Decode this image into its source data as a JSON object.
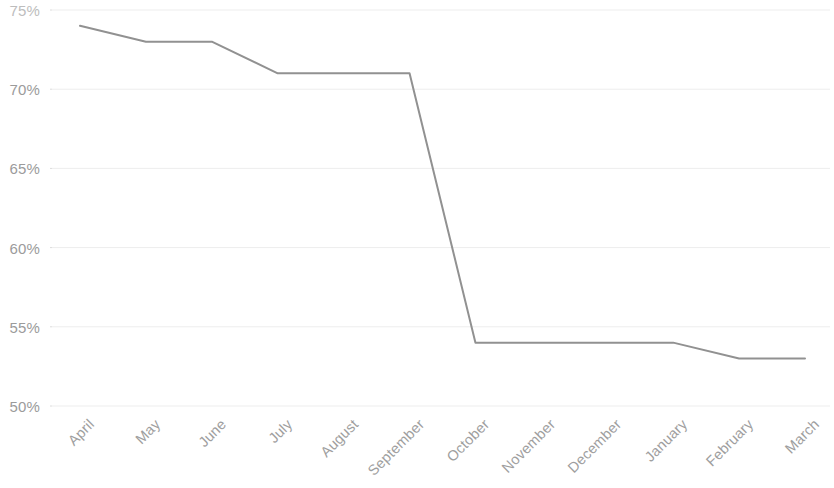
{
  "chart_data": {
    "type": "line",
    "title": "",
    "subtitle": "",
    "xlabel": "",
    "ylabel": "",
    "categories": [
      "April",
      "May",
      "June",
      "July",
      "August",
      "September",
      "October",
      "November",
      "December",
      "January",
      "February",
      "March"
    ],
    "series": [
      {
        "name": "",
        "values": [
          74,
          73,
          73,
          71,
          71,
          71,
          54,
          54,
          54,
          54,
          53,
          53
        ],
        "color": "#919191"
      }
    ],
    "ylim": [
      50,
      75
    ],
    "yticks": [
      75,
      70,
      65,
      60,
      55,
      50
    ],
    "ytick_labels": [
      "75%",
      "70%",
      "65%",
      "60%",
      "55%",
      "50%"
    ],
    "ytick_label_clipped": [
      true,
      false,
      false,
      false,
      false,
      false
    ],
    "grid": true,
    "grid_axis": "y",
    "grid_color": "#ededed",
    "legend": "none",
    "axis_line": "none",
    "markers": "none",
    "line_width": 2,
    "x_label_rotation": -45,
    "annotations": []
  },
  "colors": {
    "background": "#ffffff",
    "line": "#919191",
    "gridline": "#ededed",
    "tick_text": "#9b9b9b",
    "tick_text_clipped": "#bdbdbd"
  }
}
